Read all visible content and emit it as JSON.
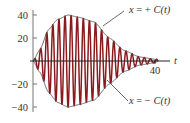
{
  "chart_data": {
    "type": "line",
    "title": "",
    "xlabel": "t",
    "ylabel": "",
    "xlim": [
      0,
      40
    ],
    "ylim": [
      -40,
      40
    ],
    "grid": false,
    "legend": "none",
    "x_ticks": [
      40
    ],
    "y_ticks": [
      40,
      20,
      -20,
      -40
    ],
    "x_tick_labels": [
      "40"
    ],
    "y_tick_labels": [
      "40",
      "20",
      "−20",
      "−40"
    ],
    "series": [
      {
        "name": "x(t) oscillation",
        "color": "#8b1a1f",
        "description": "rapidly oscillating curve bounded by ±C(t), period about 2",
        "period": 2.0
      },
      {
        "name": "x = + C(t)",
        "color": "#555555",
        "x": [
          0,
          2.3,
          5,
          8,
          11.5,
          15,
          20,
          25,
          30,
          35,
          40
        ],
        "values": [
          0,
          10,
          27,
          36,
          40,
          38,
          34,
          20,
          9,
          3.5,
          1.5
        ]
      },
      {
        "name": "x = − C(t)",
        "color": "#555555",
        "x": [
          0,
          2.3,
          5,
          8,
          11.5,
          15,
          20,
          25,
          30,
          35,
          40
        ],
        "values": [
          0,
          -10,
          -27,
          -36,
          -40,
          -38,
          -34,
          -20,
          -9,
          -3.5,
          -1.5
        ]
      }
    ],
    "annotations": [
      "x = + C(t)",
      "x = − C(t)"
    ]
  },
  "labels": {
    "y_ticks": [
      "40",
      "20",
      "−20",
      "−40"
    ],
    "x_tick": "40",
    "x_axis": "t",
    "upper_ann_prefix": "x",
    "upper_ann_op": " = + ",
    "upper_ann_fn": "C(t)",
    "lower_ann_prefix": "x",
    "lower_ann_op": " = − ",
    "lower_ann_fn": "C(t)"
  },
  "colors": {
    "oscillation": "#8b1a1f",
    "envelope": "#555555",
    "axis": "#444444"
  }
}
